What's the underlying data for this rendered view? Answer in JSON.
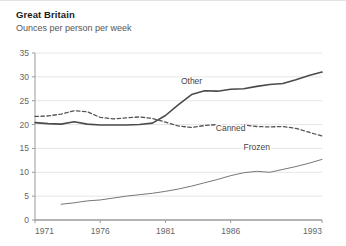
{
  "chart_data": {
    "type": "line",
    "title": "Great Britain",
    "subtitle": "Ounces per person per week",
    "ylabel": "Ounces per person per week",
    "xlabel": "",
    "ylim": [
      0,
      35
    ],
    "xlim": [
      1971,
      1993
    ],
    "grid": true,
    "legend_position": "inline-annotations",
    "yticks": [
      "0",
      "5",
      "10",
      "15",
      "20",
      "25",
      "30",
      "35"
    ],
    "ytick_values": [
      0,
      5,
      10,
      15,
      20,
      25,
      30,
      35
    ],
    "xticks": [
      "1971",
      "1976",
      "1981",
      "1986",
      "1993"
    ],
    "xtick_values": [
      1971,
      1976,
      1981,
      1986,
      1993
    ],
    "x": [
      1971,
      1972,
      1973,
      1974,
      1975,
      1976,
      1977,
      1978,
      1979,
      1980,
      1981,
      1982,
      1983,
      1984,
      1985,
      1986,
      1987,
      1988,
      1989,
      1990,
      1991,
      1992,
      1993
    ],
    "series": [
      {
        "name": "Other",
        "style": "solid",
        "width": 1.6,
        "color": "#4a4a4a",
        "label_x": 1983,
        "label_y": 28.6,
        "values": [
          20.4,
          20.2,
          20.1,
          20.6,
          20.1,
          19.9,
          19.9,
          19.9,
          20.0,
          20.3,
          21.9,
          24.2,
          26.3,
          27.1,
          27.0,
          27.4,
          27.5,
          28.0,
          28.4,
          28.6,
          29.4,
          30.3,
          31.0
        ]
      },
      {
        "name": "Canned",
        "style": "dashed",
        "width": 1.3,
        "color": "#555555",
        "label_x": 1986,
        "label_y": 18.6,
        "values": [
          21.7,
          21.8,
          22.2,
          22.9,
          22.7,
          21.5,
          21.2,
          21.4,
          21.6,
          21.3,
          20.5,
          19.7,
          19.4,
          19.8,
          20.0,
          19.7,
          19.9,
          19.6,
          19.5,
          19.6,
          19.2,
          18.4,
          17.6
        ]
      },
      {
        "name": "Frozen",
        "style": "solid",
        "width": 1.0,
        "color": "#777777",
        "label_x": 1988,
        "label_y": 14.6,
        "values": [
          null,
          null,
          3.3,
          3.6,
          4.0,
          4.2,
          4.6,
          5.0,
          5.3,
          5.6,
          6.0,
          6.5,
          7.1,
          7.8,
          8.5,
          9.3,
          9.9,
          10.2,
          10.0,
          10.6,
          11.2,
          11.9,
          12.7
        ]
      }
    ]
  }
}
